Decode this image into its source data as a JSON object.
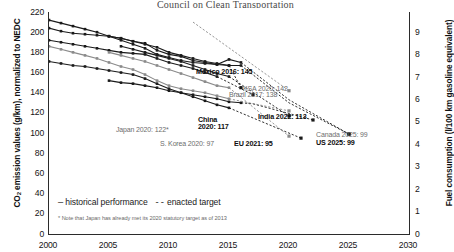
{
  "partial_header": "Council on Clean Transportation",
  "axes": {
    "left_title_pre": "CO",
    "left_title_sub": "2",
    "left_title_post": " emission values (g/km), normalized to NEDC",
    "right_title": "Fuel consumption (l/100 km gasoline equivalent)",
    "left_ticks": [
      "220",
      "200",
      "180",
      "160",
      "140",
      "120",
      "100",
      "80",
      "60",
      "40",
      "20",
      "0"
    ],
    "right_ticks": [
      "9",
      "8",
      "7",
      "6",
      "5",
      "4",
      "3",
      "2",
      "1",
      "0"
    ],
    "x_ticks": [
      "2000",
      "2005",
      "2010",
      "2015",
      "2020",
      "2025",
      "2030"
    ]
  },
  "legend": {
    "historical_dash": "—",
    "historical_label": "historical performance",
    "target_dash": "--",
    "target_label": "enacted target"
  },
  "footnote": "* Note that Japan has already met its 2020 statutory target as of 2013",
  "annotations": [
    {
      "id": "mexico",
      "text": "Mexico 2016: 145",
      "style": "bold",
      "x": 196,
      "y": 68
    },
    {
      "id": "ksa",
      "text": "KSA 2020: 142",
      "style": "light",
      "x": 243,
      "y": 85
    },
    {
      "id": "brazil",
      "text": "Brazil 2017: 138",
      "style": "light",
      "x": 229,
      "y": 91
    },
    {
      "id": "japan",
      "text": "Japan 2020: 122*",
      "style": "light",
      "x": 116,
      "y": 126
    },
    {
      "id": "china",
      "text": "China",
      "style": "bold",
      "x": 198,
      "y": 116
    },
    {
      "id": "china2",
      "text": "2020: 117",
      "style": "bold",
      "x": 198,
      "y": 123
    },
    {
      "id": "india",
      "text": "India 2022: 113",
      "style": "bold",
      "x": 258,
      "y": 113
    },
    {
      "id": "skorea",
      "text": "S. Korea 2020: 97",
      "style": "light",
      "x": 160,
      "y": 140
    },
    {
      "id": "eu",
      "text": "EU 2021: 95",
      "style": "bold",
      "x": 234,
      "y": 140
    },
    {
      "id": "canada",
      "text": "Canada 2025: 99",
      "style": "light",
      "x": 316,
      "y": 131
    },
    {
      "id": "us",
      "text": "US 2025: 99",
      "style": "bold",
      "x": 316,
      "y": 139
    }
  ],
  "chart_data": {
    "type": "line",
    "xlabel": "",
    "ylabel": "CO2 emission values (g/km), normalized to NEDC",
    "ylabel_right": "Fuel consumption (l/100 km gasoline equivalent)",
    "xlim": [
      2000,
      2030
    ],
    "ylim": [
      0,
      220
    ],
    "ylim_right": [
      0,
      9.9
    ],
    "grid": false,
    "legend_position": "bottom-left",
    "series": [
      {
        "name": "United States",
        "style": "historical",
        "color": "#1a1a1a",
        "x": [
          2000,
          2001,
          2002,
          2003,
          2004,
          2005,
          2006,
          2007,
          2008,
          2009,
          2010,
          2011,
          2012,
          2013,
          2014,
          2015,
          2016
        ],
        "y": [
          204,
          201,
          199,
          198,
          197,
          196,
          194,
          191,
          189,
          182,
          178,
          176,
          172,
          170,
          168,
          167,
          167
        ]
      },
      {
        "name": "United States target",
        "style": "target",
        "color": "#1a1a1a",
        "x": [
          2016,
          2020,
          2025
        ],
        "y": [
          167,
          130,
          99
        ]
      },
      {
        "name": "Canada",
        "style": "historical",
        "color": "#1a1a1a",
        "x": [
          2000,
          2001,
          2002,
          2003,
          2004,
          2005,
          2006,
          2007,
          2008,
          2009,
          2010,
          2011,
          2012,
          2013,
          2014,
          2015,
          2016
        ],
        "y": [
          212,
          209,
          206,
          203,
          200,
          196,
          192,
          188,
          184,
          178,
          175,
          172,
          170,
          169,
          168,
          173,
          170
        ]
      },
      {
        "name": "Canada target",
        "style": "target",
        "color": "#1a1a1a",
        "x": [
          2016,
          2020,
          2025
        ],
        "y": [
          170,
          133,
          99
        ]
      },
      {
        "name": "Mexico",
        "style": "historical",
        "color": "#1a1a1a",
        "x": [
          2005,
          2006,
          2007,
          2008,
          2009,
          2010,
          2011,
          2012,
          2013,
          2014,
          2015
        ],
        "y": [
          196,
          194,
          191,
          188,
          185,
          180,
          177,
          174,
          171,
          169,
          167
        ]
      },
      {
        "name": "Mexico target",
        "style": "target",
        "color": "#1a1a1a",
        "x": [
          2015,
          2016
        ],
        "y": [
          167,
          145
        ]
      },
      {
        "name": "Saudi Arabia (KSA)",
        "style": "target",
        "color": "#8a8a8a",
        "x": [
          2012,
          2016,
          2020
        ],
        "y": [
          210,
          176,
          142
        ]
      },
      {
        "name": "Brazil",
        "style": "historical",
        "color": "#1a1a1a",
        "x": [
          2000,
          2001,
          2002,
          2003,
          2004,
          2005,
          2006,
          2007,
          2008,
          2009,
          2010,
          2011,
          2012,
          2013,
          2014
        ],
        "y": [
          192,
          190,
          188,
          186,
          184,
          182,
          180,
          179,
          178,
          174,
          170,
          167,
          164,
          160,
          156
        ]
      },
      {
        "name": "Brazil target",
        "style": "target",
        "color": "#1a1a1a",
        "x": [
          2014,
          2017
        ],
        "y": [
          156,
          138
        ]
      },
      {
        "name": "China",
        "style": "historical",
        "color": "#1a1a1a",
        "x": [
          2006,
          2007,
          2008,
          2009,
          2010,
          2011,
          2012,
          2013,
          2014,
          2015
        ],
        "y": [
          186,
          183,
          180,
          177,
          174,
          171,
          167,
          163,
          159,
          156
        ]
      },
      {
        "name": "China target",
        "style": "target",
        "color": "#1a1a1a",
        "x": [
          2015,
          2020
        ],
        "y": [
          156,
          117
        ]
      },
      {
        "name": "India",
        "style": "historical",
        "color": "#1a1a1a",
        "x": [
          2005,
          2006,
          2007,
          2008,
          2009,
          2010,
          2011,
          2012,
          2013,
          2014,
          2015,
          2016
        ],
        "y": [
          152,
          150,
          149,
          147,
          145,
          142,
          140,
          138,
          136,
          134,
          131,
          130
        ]
      },
      {
        "name": "India target",
        "style": "target",
        "color": "#1a1a1a",
        "x": [
          2016,
          2017,
          2022
        ],
        "y": [
          130,
          129,
          113
        ]
      },
      {
        "name": "Japan",
        "style": "historical",
        "color": "#8a8a8a",
        "x": [
          2000,
          2001,
          2002,
          2003,
          2004,
          2005,
          2006,
          2007,
          2008,
          2009,
          2010,
          2011,
          2012,
          2013,
          2014,
          2015
        ],
        "y": [
          186,
          183,
          180,
          177,
          174,
          170,
          166,
          163,
          158,
          152,
          147,
          144,
          142,
          140,
          137,
          134
        ]
      },
      {
        "name": "Japan target",
        "style": "target",
        "color": "#8a8a8a",
        "x": [
          2015,
          2020
        ],
        "y": [
          134,
          122
        ]
      },
      {
        "name": "European Union",
        "style": "historical",
        "color": "#1a1a1a",
        "x": [
          2000,
          2001,
          2002,
          2003,
          2004,
          2005,
          2006,
          2007,
          2008,
          2009,
          2010,
          2011,
          2012,
          2013,
          2014,
          2015
        ],
        "y": [
          171,
          169,
          167,
          166,
          164,
          162,
          160,
          158,
          154,
          149,
          144,
          140,
          136,
          132,
          128,
          125
        ]
      },
      {
        "name": "European Union target",
        "style": "target",
        "color": "#1a1a1a",
        "x": [
          2015,
          2021
        ],
        "y": [
          125,
          95
        ]
      },
      {
        "name": "South Korea",
        "style": "historical",
        "color": "#8a8a8a",
        "x": [
          2005,
          2006,
          2007,
          2008,
          2009,
          2010,
          2011,
          2012,
          2013,
          2014,
          2015
        ],
        "y": [
          180,
          177,
          174,
          171,
          167,
          163,
          159,
          155,
          151,
          147,
          145
        ]
      },
      {
        "name": "South Korea target",
        "style": "target",
        "color": "#8a8a8a",
        "x": [
          2015,
          2020
        ],
        "y": [
          145,
          97
        ]
      }
    ]
  }
}
